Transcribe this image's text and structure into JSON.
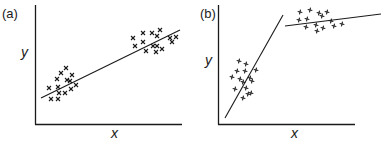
{
  "chart_data": [
    {
      "type": "scatter",
      "panel_label": "(a)",
      "xlabel": "x",
      "ylabel": "y",
      "grid": false,
      "marker": "x",
      "description": "Two clusters of points (lower-left and upper-right) fitted by a single straight regression line",
      "series": [
        {
          "name": "cluster-low",
          "points": [
            [
              66,
              68
            ],
            [
              61,
              73
            ],
            [
              72,
              75
            ],
            [
              57,
              79
            ],
            [
              67,
              80
            ],
            [
              70,
              81
            ],
            [
              49,
              88
            ],
            [
              58,
              87
            ],
            [
              71,
              89
            ],
            [
              76,
              85
            ],
            [
              51,
              99
            ],
            [
              58,
              99
            ],
            [
              59,
              93
            ],
            [
              65,
              93
            ]
          ]
        },
        {
          "name": "cluster-high",
          "points": [
            [
              143,
              33
            ],
            [
              160,
              30
            ],
            [
              152,
              33
            ],
            [
              157,
              36
            ],
            [
              133,
              38
            ],
            [
              143,
              42
            ],
            [
              135,
              46
            ],
            [
              153,
              46
            ],
            [
              162,
              49
            ],
            [
              170,
              38
            ],
            [
              172,
              42
            ],
            [
              176,
              37
            ],
            [
              146,
              51
            ],
            [
              156,
              52
            ],
            [
              157,
              46
            ]
          ]
        },
        {
          "name": "fit-line",
          "line": [
            [
              41,
              98
            ],
            [
              180,
              30
            ]
          ]
        }
      ]
    },
    {
      "type": "scatter",
      "panel_label": "(b)",
      "xlabel": "x",
      "ylabel": "y",
      "grid": false,
      "marker": "+",
      "description": "Two clusters each fitted by its own regression line: steep line through lower cluster, nearly flat line through upper cluster",
      "series": [
        {
          "name": "cluster-low",
          "points": [
            [
              239,
              61
            ],
            [
              246,
              64
            ],
            [
              237,
              71
            ],
            [
              245,
              71
            ],
            [
              256,
              70
            ],
            [
              232,
              77
            ],
            [
              240,
              79
            ],
            [
              250,
              78
            ],
            [
              243,
              82
            ],
            [
              252,
              81
            ],
            [
              235,
              89
            ],
            [
              246,
              88
            ],
            [
              251,
              93
            ],
            [
              243,
              98
            ],
            [
              248,
              94
            ]
          ]
        },
        {
          "name": "cluster-high",
          "points": [
            [
              300,
              12
            ],
            [
              310,
              10
            ],
            [
              319,
              13
            ],
            [
              327,
              12
            ],
            [
              299,
              20
            ],
            [
              307,
              19
            ],
            [
              322,
              16
            ],
            [
              316,
              25
            ],
            [
              331,
              21
            ],
            [
              334,
              26
            ],
            [
              342,
              24
            ],
            [
              306,
              27
            ],
            [
              317,
              31
            ],
            [
              323,
              28
            ]
          ]
        },
        {
          "name": "fit-line-steep",
          "line": [
            [
              225,
              118
            ],
            [
              283,
              15
            ]
          ]
        },
        {
          "name": "fit-line-flat",
          "line": [
            [
              285,
              26
            ],
            [
              381,
              14
            ]
          ]
        }
      ]
    }
  ],
  "panels": {
    "a": {
      "label": "(a)",
      "xlabel": "x",
      "ylabel": "y"
    },
    "b": {
      "label": "(b)",
      "xlabel": "x",
      "ylabel": "y"
    }
  },
  "style": {
    "ink": "#1a1a1a",
    "background": "#ffffff"
  }
}
